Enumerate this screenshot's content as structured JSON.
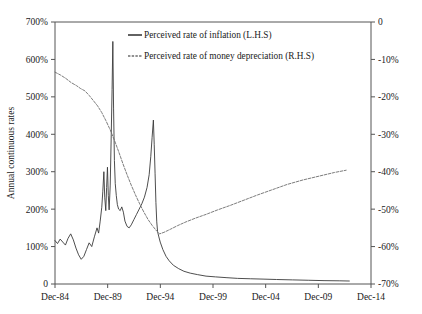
{
  "chart_data": {
    "type": "line",
    "title": "",
    "xlabel": "",
    "ylabel": "Annual continuous rates",
    "ylabel_right": "",
    "grid": false,
    "legend_position": "top-center",
    "x_tick_labels": [
      "Dec-84",
      "Dec-89",
      "Dec-94",
      "Dec-99",
      "Dec-04",
      "Dec-09",
      "Dec-14"
    ],
    "x_tick_values": [
      1984.96,
      1989.96,
      1994.96,
      1999.96,
      2004.96,
      2009.96,
      2014.96
    ],
    "xlim": [
      1984.96,
      2014.96
    ],
    "left_axis": {
      "tick_labels": [
        "0",
        "100%",
        "200%",
        "300%",
        "400%",
        "500%",
        "600%",
        "700%"
      ],
      "tick_values": [
        0,
        100,
        200,
        300,
        400,
        500,
        600,
        700
      ],
      "ylim": [
        0,
        700
      ]
    },
    "right_axis": {
      "tick_labels": [
        "0",
        "-10%",
        "-20%",
        "-30%",
        "-40%",
        "-50%",
        "-60%",
        "-70%"
      ],
      "tick_values": [
        0,
        -10,
        -20,
        -30,
        -40,
        -50,
        -60,
        -70
      ],
      "ylim": [
        -70,
        0
      ]
    },
    "series": [
      {
        "name": "Perceived rate of inflation (L.H.S)",
        "axis": "left",
        "style": "solid",
        "color": "#3a3a3a",
        "points": [
          [
            1984.96,
            116
          ],
          [
            1985.2,
            108
          ],
          [
            1985.45,
            120
          ],
          [
            1985.7,
            112
          ],
          [
            1985.95,
            104
          ],
          [
            1986.2,
            122
          ],
          [
            1986.45,
            134
          ],
          [
            1986.7,
            118
          ],
          [
            1986.95,
            96
          ],
          [
            1987.2,
            78
          ],
          [
            1987.45,
            66
          ],
          [
            1987.7,
            74
          ],
          [
            1987.95,
            92
          ],
          [
            1988.2,
            110
          ],
          [
            1988.45,
            100
          ],
          [
            1988.7,
            126
          ],
          [
            1988.95,
            150
          ],
          [
            1989.1,
            136
          ],
          [
            1989.25,
            168
          ],
          [
            1989.4,
            205
          ],
          [
            1989.5,
            248
          ],
          [
            1989.6,
            300
          ],
          [
            1989.68,
            232
          ],
          [
            1989.78,
            196
          ],
          [
            1989.86,
            258
          ],
          [
            1989.94,
            312
          ],
          [
            1990.02,
            236
          ],
          [
            1990.1,
            198
          ],
          [
            1990.2,
            262
          ],
          [
            1990.3,
            400
          ],
          [
            1990.38,
            520
          ],
          [
            1990.45,
            648
          ],
          [
            1990.52,
            470
          ],
          [
            1990.6,
            330
          ],
          [
            1990.68,
            268
          ],
          [
            1990.78,
            236
          ],
          [
            1990.88,
            212
          ],
          [
            1991.0,
            200
          ],
          [
            1991.15,
            196
          ],
          [
            1991.3,
            206
          ],
          [
            1991.45,
            192
          ],
          [
            1991.6,
            168
          ],
          [
            1991.8,
            154
          ],
          [
            1992.0,
            150
          ],
          [
            1992.2,
            158
          ],
          [
            1992.45,
            172
          ],
          [
            1992.7,
            186
          ],
          [
            1992.95,
            200
          ],
          [
            1993.2,
            214
          ],
          [
            1993.45,
            232
          ],
          [
            1993.7,
            258
          ],
          [
            1993.9,
            292
          ],
          [
            1994.05,
            340
          ],
          [
            1994.18,
            392
          ],
          [
            1994.3,
            438
          ],
          [
            1994.38,
            372
          ],
          [
            1994.46,
            296
          ],
          [
            1994.54,
            218
          ],
          [
            1994.62,
            166
          ],
          [
            1994.7,
            140
          ],
          [
            1994.8,
            128
          ],
          [
            1994.95,
            112
          ],
          [
            1995.2,
            92
          ],
          [
            1995.5,
            74
          ],
          [
            1995.8,
            62
          ],
          [
            1996.2,
            50
          ],
          [
            1996.7,
            41
          ],
          [
            1997.2,
            34
          ],
          [
            1997.8,
            29
          ],
          [
            1998.5,
            25
          ],
          [
            1999.3,
            21
          ],
          [
            2000.2,
            19
          ],
          [
            2001.2,
            17
          ],
          [
            2002.3,
            15
          ],
          [
            2003.5,
            14
          ],
          [
            2004.8,
            13
          ],
          [
            2006.0,
            12
          ],
          [
            2007.5,
            11
          ],
          [
            2009.0,
            10
          ],
          [
            2010.5,
            9
          ],
          [
            2012.0,
            8.5
          ],
          [
            2012.9,
            8
          ]
        ]
      },
      {
        "name": "Perceived rate of money depreciation (R.H.S)",
        "axis": "right",
        "style": "dashed",
        "color": "#6d6d6d",
        "points": [
          [
            1984.96,
            -13.4
          ],
          [
            1985.5,
            -14.2
          ],
          [
            1986.0,
            -15.1
          ],
          [
            1986.5,
            -16.2
          ],
          [
            1987.0,
            -17.0
          ],
          [
            1987.4,
            -17.8
          ],
          [
            1987.8,
            -18.4
          ],
          [
            1988.2,
            -19.6
          ],
          [
            1988.6,
            -21.0
          ],
          [
            1989.0,
            -22.4
          ],
          [
            1989.4,
            -24.2
          ],
          [
            1989.8,
            -26.4
          ],
          [
            1990.2,
            -28.8
          ],
          [
            1990.6,
            -31.6
          ],
          [
            1991.0,
            -34.6
          ],
          [
            1991.4,
            -37.8
          ],
          [
            1991.8,
            -40.8
          ],
          [
            1992.2,
            -43.6
          ],
          [
            1992.6,
            -46.2
          ],
          [
            1993.0,
            -48.6
          ],
          [
            1993.4,
            -50.8
          ],
          [
            1993.8,
            -52.8
          ],
          [
            1994.2,
            -54.4
          ],
          [
            1994.6,
            -55.8
          ],
          [
            1994.9,
            -56.6
          ],
          [
            1995.3,
            -56.2
          ],
          [
            1995.9,
            -55.4
          ],
          [
            1996.6,
            -54.4
          ],
          [
            1997.4,
            -53.4
          ],
          [
            1998.3,
            -52.4
          ],
          [
            1999.3,
            -51.4
          ],
          [
            2000.4,
            -50.2
          ],
          [
            2001.6,
            -49.0
          ],
          [
            2002.9,
            -47.6
          ],
          [
            2004.2,
            -46.2
          ],
          [
            2005.6,
            -44.8
          ],
          [
            2007.0,
            -43.4
          ],
          [
            2008.5,
            -42.2
          ],
          [
            2010.0,
            -41.2
          ],
          [
            2011.5,
            -40.2
          ],
          [
            2012.6,
            -39.6
          ]
        ]
      }
    ]
  },
  "legend": {
    "items": [
      {
        "label": "Perceived rate of inflation (L.H.S)",
        "style": "solid"
      },
      {
        "label": "Perceived rate of money depreciation (R.H.S)",
        "style": "dashed"
      }
    ]
  }
}
